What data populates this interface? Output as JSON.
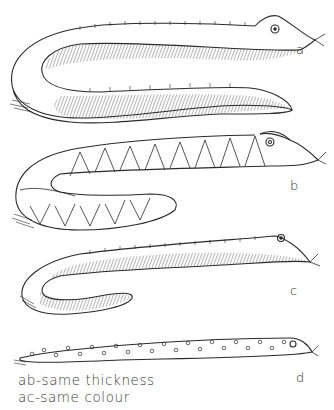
{
  "figure": {
    "ink_color": "#2a2a2a",
    "background": "#ffffff",
    "snakes": [
      {
        "id": "a",
        "label": "a",
        "pattern": "hatched-with-ridge-ticks",
        "shape": "U-bend, thick"
      },
      {
        "id": "b",
        "label": "b",
        "pattern": "scale-arches",
        "shape": "U-bend, thick"
      },
      {
        "id": "c",
        "label": "c",
        "pattern": "hatched-with-ridge-ticks",
        "shape": "J-bend, thin"
      },
      {
        "id": "d",
        "label": "d",
        "pattern": "spots",
        "shape": "straight, thin"
      }
    ],
    "captions": [
      "ab-same thickness",
      "ac-same colour"
    ]
  }
}
